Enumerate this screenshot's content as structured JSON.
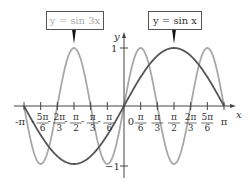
{
  "chart_data": {
    "type": "line",
    "title": "",
    "xlabel": "x",
    "ylabel": "y",
    "xlim": [
      -3.14159,
      3.14159
    ],
    "ylim": [
      -1,
      1
    ],
    "grid": false,
    "legend": "callout boxes above curves",
    "x_tick_labels": [
      "-π",
      "-5π/6",
      "-2π/3",
      "-π/2",
      "-π/3",
      "-π/6",
      "0",
      "π/6",
      "π/3",
      "π/2",
      "2π/3",
      "5π/6",
      "π"
    ],
    "x_ticks": [
      -3.14159,
      -2.61799,
      -2.0944,
      -1.5708,
      -1.0472,
      -0.5236,
      0,
      0.5236,
      1.0472,
      1.5708,
      2.0944,
      2.61799,
      3.14159
    ],
    "y_tick_labels": [
      "1",
      "-1"
    ],
    "y_ticks": [
      1,
      -1
    ],
    "series": [
      {
        "name": "y = sin 3x",
        "color": "#a8a8a8",
        "function": "sin(3x)",
        "x": [
          "-π",
          "-5π/6",
          "-2π/3",
          "-π/2",
          "-π/3",
          "-π/6",
          "0",
          "π/6",
          "π/3",
          "π/2",
          "2π/3",
          "5π/6",
          "π"
        ],
        "values": [
          0,
          -1,
          0,
          1,
          0,
          -1,
          0,
          1,
          0,
          -1,
          0,
          1,
          0
        ]
      },
      {
        "name": "y = sin x",
        "color": "#555555",
        "function": "sin(x)",
        "x": [
          "-π",
          "-5π/6",
          "-2π/3",
          "-π/2",
          "-π/3",
          "-π/6",
          "0",
          "π/6",
          "π/3",
          "π/2",
          "2π/3",
          "5π/6",
          "π"
        ],
        "values": [
          0,
          -0.5,
          -0.87,
          -1,
          -0.87,
          -0.5,
          0,
          0.5,
          0.87,
          1,
          0.87,
          0.5,
          0
        ]
      }
    ]
  },
  "labels": {
    "sin3x_box": "y = sin 3x",
    "sinx_box": "y = sin x",
    "x_axis": "x",
    "y_axis": "y",
    "y_one": "1",
    "y_neg_one": "−1",
    "origin": "0"
  },
  "colors": {
    "sin3x": "#a8a8a8",
    "sinx": "#555555",
    "axis": "#444444"
  }
}
